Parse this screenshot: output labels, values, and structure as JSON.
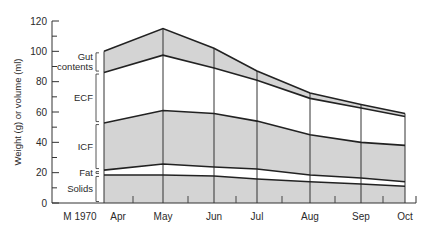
{
  "chart_data": {
    "type": "area",
    "title": "",
    "xlabel": "",
    "ylabel": "Weight (g) or volume (ml)",
    "ylim": [
      0,
      120
    ],
    "yticks": [
      0,
      20,
      40,
      60,
      80,
      100,
      120
    ],
    "y_minor_step": 10,
    "x_start_label": "M 1970",
    "categories": [
      "Apr",
      "May",
      "Jun",
      "Jul",
      "Aug",
      "Sep",
      "Oct"
    ],
    "stacked_boundaries_note": "values are cumulative tops of each stacked band",
    "series": [
      {
        "name": "Solids",
        "fill": "#d4d4d4",
        "top_values": [
          18.5,
          18.5,
          17.8,
          15.8,
          14,
          12.5,
          11
        ]
      },
      {
        "name": "Fat",
        "fill": "#ffffff",
        "top_values": [
          21.7,
          25.7,
          23.7,
          22.4,
          18.5,
          16.5,
          14
        ]
      },
      {
        "name": "ICF",
        "fill": "#d4d4d4",
        "top_values": [
          52.7,
          61,
          59,
          54,
          45,
          40,
          38
        ]
      },
      {
        "name": "ECF",
        "fill": "#ffffff",
        "top_values": [
          86,
          97.5,
          89,
          81,
          69,
          62.6,
          57
        ]
      },
      {
        "name": "Gut contents",
        "fill": "#d4d4d4",
        "top_values": [
          100,
          115,
          102,
          87,
          72.5,
          65,
          59
        ]
      }
    ],
    "band_labels": [
      {
        "name": "Gut contents",
        "lines": [
          "Gut",
          "contents"
        ]
      },
      {
        "name": "ECF",
        "lines": [
          "ECF"
        ]
      },
      {
        "name": "ICF",
        "lines": [
          "ICF"
        ]
      },
      {
        "name": "Fat",
        "lines": [
          "Fat"
        ]
      },
      {
        "name": "Solids",
        "lines": [
          "Solids"
        ]
      }
    ],
    "grid": false,
    "legend": "bracket labels on left"
  }
}
